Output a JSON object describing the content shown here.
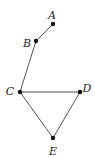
{
  "diagram": {
    "type": "graph",
    "nodes": [
      {
        "id": "A",
        "label": "A",
        "x": 53,
        "y": 24,
        "lx": 52,
        "ly": 16
      },
      {
        "id": "B",
        "label": "B",
        "x": 36,
        "y": 41,
        "lx": 27,
        "ly": 44
      },
      {
        "id": "C",
        "label": "C",
        "x": 20,
        "y": 92,
        "lx": 10,
        "ly": 92
      },
      {
        "id": "D",
        "label": "D",
        "x": 80,
        "y": 92,
        "lx": 87,
        "ly": 89
      },
      {
        "id": "E",
        "label": "E",
        "x": 53,
        "y": 138,
        "lx": 53,
        "ly": 152
      }
    ],
    "edges": [
      {
        "from": "A",
        "to": "B"
      },
      {
        "from": "B",
        "to": "C"
      },
      {
        "from": "C",
        "to": "D"
      },
      {
        "from": "C",
        "to": "E"
      },
      {
        "from": "D",
        "to": "E"
      }
    ]
  }
}
